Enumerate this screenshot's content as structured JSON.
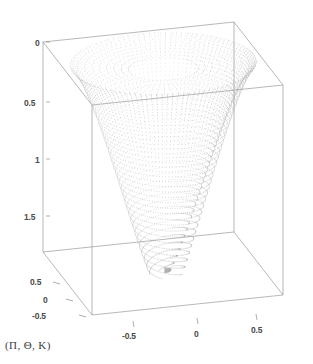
{
  "figure": {
    "width": 313,
    "height": 364,
    "background": "#ffffff",
    "caption": "(Π, Θ, K)",
    "caption_name": "axis-triple-caption"
  },
  "style": {
    "box_line_color": "#9a9a9a",
    "tick_line_color": "#8c8c8c",
    "tick_text_color": "#4a4a4a",
    "point_color": "#b9b9b9",
    "point_color_dark": "#8f8f8f",
    "caption_color": "#3c3c3c"
  },
  "chart_data": {
    "type": "scatter",
    "render": "3d-point-cloud",
    "title": "",
    "subtitle": "",
    "xlabel": "",
    "ylabel": "",
    "zlabel": "",
    "grid": false,
    "legend": null,
    "projection": "axonometric",
    "axes": {
      "x": {
        "name": "x-axis",
        "position": "bottom-front",
        "ticks": [
          -0.5,
          0,
          0.5
        ],
        "tick_labels": [
          "-0.5",
          "0",
          "0.5"
        ],
        "range": [
          -0.85,
          0.85
        ]
      },
      "y": {
        "name": "depth-axis",
        "position": "bottom-left",
        "ticks": [
          0.5,
          0,
          -0.5
        ],
        "tick_labels": [
          "0.5",
          "0",
          "-0.5"
        ],
        "range": [
          -0.85,
          0.85
        ]
      },
      "z": {
        "name": "vertical-axis",
        "position": "left",
        "ticks": [
          0,
          0.5,
          1,
          1.5
        ],
        "tick_labels": [
          "0",
          "0.5",
          "1",
          "1.5"
        ],
        "range": [
          0,
          1.95
        ],
        "direction": "downward-increasing"
      }
    },
    "surface": {
      "kind": "riemann-sheet-funnel",
      "branch_cut": true,
      "turns": 1.25,
      "mouth_radius": 0.8,
      "tip_z": 1.9,
      "sampling": {
        "radial": 46,
        "angular": 132
      }
    }
  },
  "axis_ticks": {
    "z": [
      {
        "label": "0",
        "x": 35,
        "y": 38,
        "tick_x1": 46,
        "tick_y1": 42,
        "tick_x2": 50,
        "tick_y2": 42
      },
      {
        "label": "0.5",
        "x": 24,
        "y": 98,
        "tick_x1": 46,
        "tick_y1": 102,
        "tick_x2": 50,
        "tick_y2": 102
      },
      {
        "label": "1",
        "x": 35,
        "y": 155,
        "tick_x1": 46,
        "tick_y1": 159,
        "tick_x2": 50,
        "tick_y2": 159
      },
      {
        "label": "1.5",
        "x": 24,
        "y": 212,
        "tick_x1": 46,
        "tick_y1": 216,
        "tick_x2": 50,
        "tick_y2": 216
      }
    ],
    "y": [
      {
        "label": "0.5",
        "x": 30,
        "y": 277,
        "tick_x1": 53,
        "tick_y1": 282,
        "tick_x2": 60,
        "tick_y2": 284
      },
      {
        "label": "0",
        "x": 43,
        "y": 295,
        "tick_x1": 66,
        "tick_y1": 299,
        "tick_x2": 73,
        "tick_y2": 301
      },
      {
        "label": "-0.5",
        "x": 32,
        "y": 311,
        "tick_x1": 79,
        "tick_y1": 315,
        "tick_x2": 86,
        "tick_y2": 317
      }
    ],
    "x": [
      {
        "label": "-0.5",
        "x": 122,
        "y": 331,
        "tick_x1": 133,
        "tick_y1": 321,
        "tick_x2": 134,
        "tick_y2": 327
      },
      {
        "label": "0",
        "x": 194,
        "y": 329,
        "tick_x1": 197,
        "tick_y1": 318,
        "tick_x2": 198,
        "tick_y2": 324
      },
      {
        "label": "0.5",
        "x": 251,
        "y": 325,
        "tick_x1": 256,
        "tick_y1": 314,
        "tick_x2": 257,
        "tick_y2": 320
      }
    ]
  },
  "box": {
    "name": "bounding-box-wireframe",
    "vertices": {
      "front_top_left": [
        92,
        105
      ],
      "front_top_right": [
        283,
        85
      ],
      "back_top_left": [
        43,
        42
      ],
      "back_top_right": [
        234,
        22
      ],
      "front_bot_left": [
        92,
        315
      ],
      "front_bot_right": [
        283,
        295
      ],
      "back_bot_left": [
        43,
        252
      ],
      "back_bot_right": [
        234,
        232
      ]
    }
  }
}
